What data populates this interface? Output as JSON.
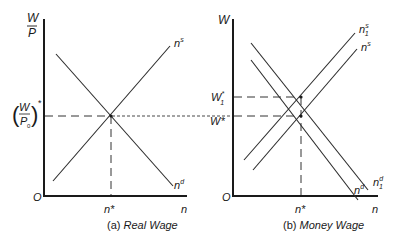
{
  "panels": {
    "a": {
      "y_axis_label_top": "W",
      "y_axis_label_bottom": "P",
      "y_equilibrium_label": {
        "open": "(",
        "num": "W",
        "den": "P",
        "den_sub": "0",
        "close": ")",
        "star": "*"
      },
      "origin": "O",
      "x_axis_label": "n",
      "x_equilibrium_label": "n*",
      "supply_label": {
        "base": "n",
        "sup": "s"
      },
      "demand_label": {
        "base": "n",
        "sup": "d"
      },
      "caption_prefix": "(a)",
      "caption_title": "Real Wage"
    },
    "b": {
      "y_axis_label": "W",
      "w1_label": {
        "base": "W",
        "sup": "*",
        "sub": "1"
      },
      "w_label": "W*",
      "origin": "O",
      "x_axis_label": "n",
      "x_equilibrium_label": "n*",
      "supply1_label": {
        "base": "n",
        "sup": "s",
        "sub": "1"
      },
      "supply_label": {
        "base": "n",
        "sup": "s"
      },
      "demand1_label": {
        "base": "n",
        "sup": "d",
        "sub": "1"
      },
      "demand_label": {
        "base": "n",
        "sup": "d"
      },
      "caption_prefix": "(b)",
      "caption_title": "Money Wage"
    }
  }
}
